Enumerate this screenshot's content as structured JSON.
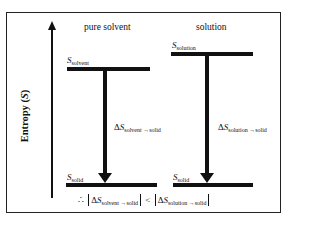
{
  "diagram": {
    "y_axis": {
      "label_main": "Entropy (",
      "label_symbol": "S",
      "label_close": ")"
    },
    "columns": [
      {
        "title": "pure solvent",
        "top_level": {
          "symbol": "S",
          "subscript": "solvent"
        },
        "bottom_level": {
          "symbol": "S",
          "subscript": "solid"
        },
        "arrow_label": {
          "delta": "Δ",
          "symbol": "S",
          "subscript": "solvent →solid"
        }
      },
      {
        "title": "solution",
        "top_level": {
          "symbol": "S",
          "subscript": "solution"
        },
        "bottom_level": {
          "symbol": "S",
          "subscript": "solid"
        },
        "arrow_label": {
          "delta": "Δ",
          "symbol": "S",
          "subscript": "solution →solid"
        }
      }
    ],
    "conclusion": {
      "therefore": "∴",
      "left": {
        "delta": "Δ",
        "symbol": "S",
        "subscript": "solvent →solid"
      },
      "operator": "<",
      "right": {
        "delta": "Δ",
        "symbol": "S",
        "subscript": "solution →solid"
      }
    }
  }
}
